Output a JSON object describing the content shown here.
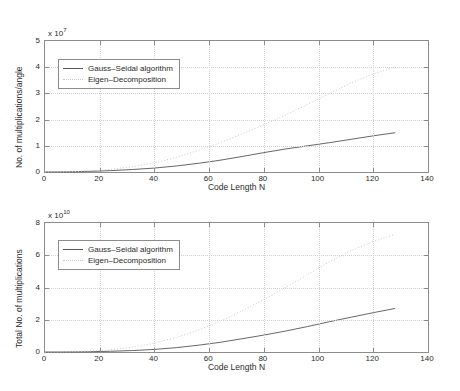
{
  "chart_data": [
    {
      "id": "top",
      "type": "line",
      "title": "",
      "xlabel": "Code Length N",
      "ylabel": "No. of multiplications/angle",
      "y_exponent_prefix": "x 10",
      "y_exponent": "7",
      "xlim": [
        0,
        140
      ],
      "ylim": [
        0,
        5
      ],
      "xticks": [
        0,
        20,
        40,
        60,
        80,
        100,
        120,
        140
      ],
      "yticks": [
        0,
        1,
        2,
        3,
        4,
        5
      ],
      "xticklabels": [
        "0",
        "20",
        "40",
        "60",
        "80",
        "100",
        "120",
        "140"
      ],
      "yticklabels": [
        "0",
        "1",
        "2",
        "3",
        "4",
        "5"
      ],
      "grid": true,
      "legend_position": "upper left",
      "series": [
        {
          "name": "Gauss-Seidal algorithm",
          "style": "solid",
          "color": "#555555",
          "x": [
            0,
            8,
            16,
            24,
            32,
            40,
            48,
            56,
            64,
            72,
            80,
            88,
            96,
            104,
            112,
            120,
            128
          ],
          "y": [
            0.0,
            0.006,
            0.024,
            0.053,
            0.095,
            0.15,
            0.23,
            0.33,
            0.45,
            0.59,
            0.74,
            0.88,
            1.0,
            1.12,
            1.25,
            1.38,
            1.5
          ]
        },
        {
          "name": "Eigen-Decomposition",
          "style": "dotted",
          "color": "#c9c9c9",
          "x": [
            0,
            8,
            16,
            24,
            32,
            40,
            48,
            56,
            64,
            72,
            80,
            88,
            96,
            104,
            112,
            120,
            128
          ],
          "y": [
            0.0,
            0.01,
            0.04,
            0.1,
            0.2,
            0.35,
            0.56,
            0.82,
            1.12,
            1.45,
            1.8,
            2.18,
            2.58,
            3.0,
            3.4,
            3.74,
            4.0
          ]
        }
      ]
    },
    {
      "id": "bottom",
      "type": "line",
      "title": "",
      "xlabel": "Code Length N",
      "ylabel": "Total No. of multiplications",
      "y_exponent_prefix": "x 10",
      "y_exponent": "10",
      "xlim": [
        0,
        140
      ],
      "ylim": [
        0,
        8
      ],
      "xticks": [
        0,
        20,
        40,
        60,
        80,
        100,
        120,
        140
      ],
      "yticks": [
        0,
        2,
        4,
        6,
        8
      ],
      "xticklabels": [
        "0",
        "20",
        "40",
        "60",
        "80",
        "100",
        "120",
        "140"
      ],
      "yticklabels": [
        "0",
        "2",
        "4",
        "6",
        "8"
      ],
      "grid": true,
      "legend_position": "upper left",
      "series": [
        {
          "name": "Gauss-Seidal algorithm",
          "style": "solid",
          "color": "#555555",
          "x": [
            0,
            8,
            16,
            24,
            32,
            40,
            48,
            56,
            64,
            72,
            80,
            88,
            96,
            104,
            112,
            120,
            128
          ],
          "y": [
            0.0,
            0.004,
            0.018,
            0.045,
            0.09,
            0.16,
            0.27,
            0.42,
            0.6,
            0.82,
            1.05,
            1.3,
            1.58,
            1.88,
            2.16,
            2.44,
            2.7
          ]
        },
        {
          "name": "Eigen-Decomposition",
          "style": "dotted",
          "color": "#c9c9c9",
          "x": [
            0,
            8,
            16,
            24,
            32,
            40,
            48,
            56,
            64,
            72,
            80,
            88,
            96,
            104,
            112,
            120,
            128
          ],
          "y": [
            0.0,
            0.01,
            0.05,
            0.14,
            0.3,
            0.55,
            0.9,
            1.35,
            1.9,
            2.55,
            3.25,
            4.0,
            4.8,
            5.6,
            6.3,
            6.85,
            7.3
          ]
        }
      ]
    }
  ],
  "panels": {
    "top": {
      "exp_prefix": "x 10",
      "exp_value": "7",
      "ylabel": "No. of multiplications/angle",
      "xlabel": "Code Length N",
      "legend": {
        "entry1": "Gauss–Seidal algorithm",
        "entry2": "Eigen–Decomposition"
      }
    },
    "bottom": {
      "exp_prefix": "x 10",
      "exp_value": "10",
      "ylabel": "Total No. of multiplications",
      "xlabel": "Code Length N",
      "legend": {
        "entry1": "Gauss–Seidal algorithm",
        "entry2": "Eigen–Decomposition"
      }
    }
  },
  "colors": {
    "axis": "#8c8c8c",
    "grid": "#d2d2d2",
    "solid_series": "#555555",
    "dotted_series": "#c9c9c9",
    "background": "#ffffff"
  }
}
